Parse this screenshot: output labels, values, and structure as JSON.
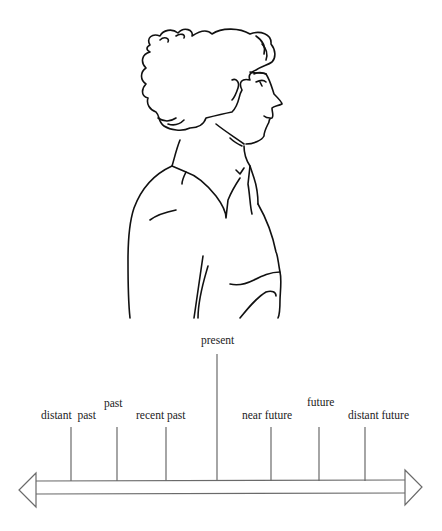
{
  "diagram": {
    "type": "timeline",
    "labels": {
      "present": "present",
      "distant_past": "distant  past",
      "past": "past",
      "recent_past": "recent past",
      "near_future": "near future",
      "future": "future",
      "distant_future": "distant future"
    },
    "ticks": [
      {
        "id": "distant_past",
        "x": 71
      },
      {
        "id": "past",
        "x": 117
      },
      {
        "id": "recent_past",
        "x": 166
      },
      {
        "id": "present",
        "x": 217
      },
      {
        "id": "near_future",
        "x": 271
      },
      {
        "id": "future",
        "x": 319
      },
      {
        "id": "distant_future",
        "x": 365
      }
    ],
    "arrow": "double-headed, pointing left (past) and right (future)",
    "line_color": "#6a6a6a"
  }
}
